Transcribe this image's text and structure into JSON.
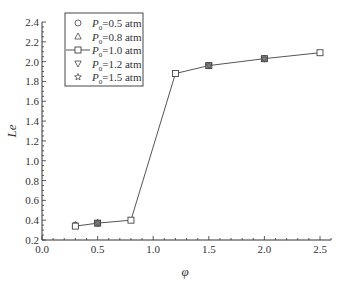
{
  "chart_data": {
    "type": "line",
    "title": "",
    "xlabel": "φ",
    "ylabel": "Le",
    "xlim": [
      0.0,
      2.6
    ],
    "ylim": [
      0.2,
      2.4
    ],
    "xticks": [
      0.0,
      0.5,
      1.0,
      1.5,
      2.0,
      2.5
    ],
    "xtick_labels": [
      "0.0",
      "0.5",
      "1.0",
      "1.5",
      "2.0",
      "2.5"
    ],
    "yticks": [
      0.2,
      0.4,
      0.6,
      0.8,
      1.0,
      1.2,
      1.4,
      1.6,
      1.8,
      2.0,
      2.2,
      2.4
    ],
    "ytick_labels": [
      "0.2",
      "0.4",
      "0.6",
      "0.8",
      "1.0",
      "1.2",
      "1.4",
      "1.6",
      "1.8",
      "2.0",
      "2.2",
      "2.4"
    ],
    "grid": false,
    "legend_position": "upper left",
    "x": [
      0.3,
      0.5,
      0.8,
      1.2,
      1.5,
      2.0,
      2.5
    ],
    "series": [
      {
        "name": "P0=0.5 atm",
        "marker": "circle",
        "line": false,
        "values": [
          0.34,
          0.37,
          0.4,
          1.88,
          1.96,
          2.03,
          2.09
        ]
      },
      {
        "name": "P0=0.8 atm",
        "marker": "triangle-up",
        "line": false,
        "values": [
          0.34,
          0.37,
          0.4,
          1.88,
          1.96,
          2.03,
          2.09
        ]
      },
      {
        "name": "P0=1.0 atm",
        "marker": "square",
        "line": true,
        "values": [
          0.34,
          0.37,
          0.4,
          1.88,
          1.96,
          2.03,
          2.09
        ]
      },
      {
        "name": "P0=1.2 atm",
        "marker": "triangle-down",
        "line": false,
        "values": [
          0.34,
          0.37,
          0.4,
          1.88,
          1.96,
          2.03,
          2.09
        ]
      },
      {
        "name": "P0=1.5 atm",
        "marker": "star",
        "line": false,
        "values": [
          0.34,
          0.37,
          0.4,
          1.88,
          1.96,
          2.03,
          2.09
        ]
      }
    ]
  },
  "legend": [
    {
      "symbol": "○",
      "label_main": "P",
      "label_sub": "0",
      "label_rest": "=0.5 atm"
    },
    {
      "symbol": "△",
      "label_main": "P",
      "label_sub": "0",
      "label_rest": "=0.8 atm"
    },
    {
      "symbol": "□",
      "label_main": "P",
      "label_sub": "0",
      "label_rest": "=1.0 atm"
    },
    {
      "symbol": "▽",
      "label_main": "P",
      "label_sub": "0",
      "label_rest": "=1.2 atm"
    },
    {
      "symbol": "☆",
      "label_main": "P",
      "label_sub": "0",
      "label_rest": "=1.5 atm"
    }
  ],
  "colors": {
    "axis": "#333333",
    "line": "#555555",
    "marker_stroke": "#444444",
    "marker_overlap_fill": "#666666"
  }
}
